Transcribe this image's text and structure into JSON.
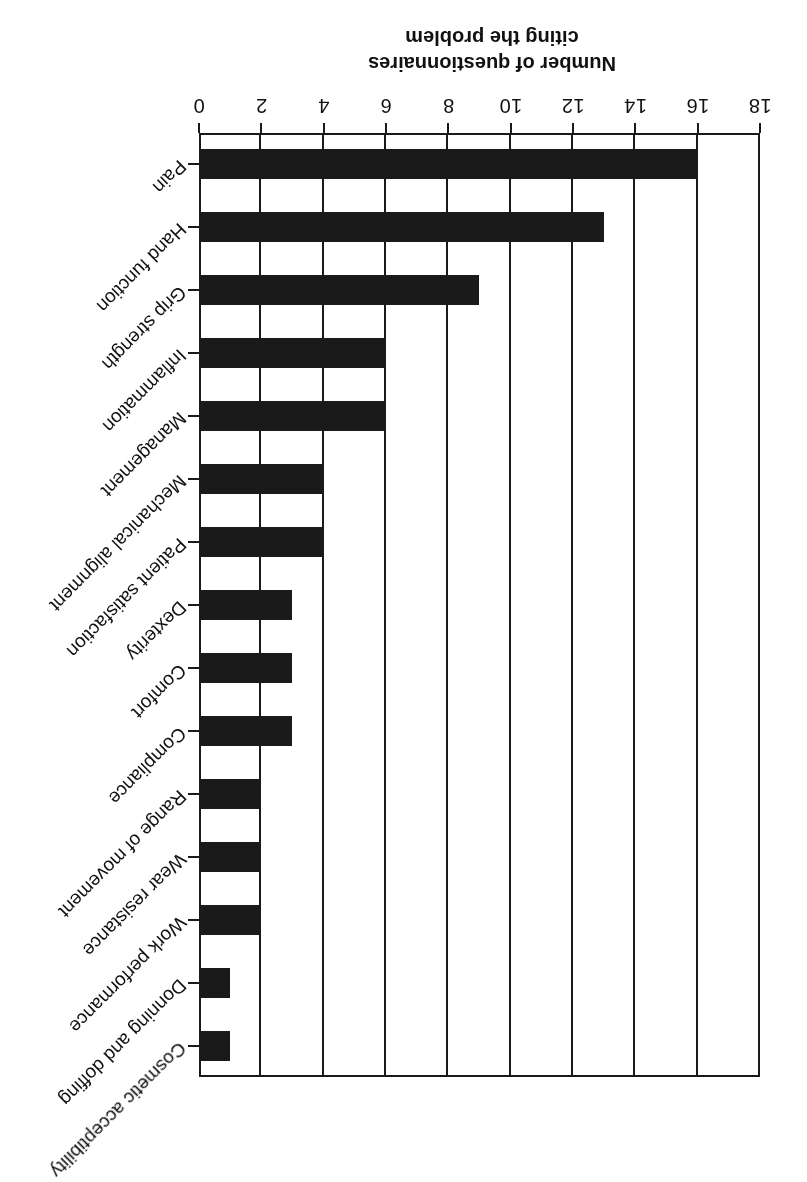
{
  "chart_data": {
    "type": "bar",
    "orientation": "horizontal",
    "title": "",
    "subtitle": "",
    "xlabel": "Number of questionnaires citing the problem",
    "ylabel": "",
    "xlim": [
      0,
      18
    ],
    "xticks": [
      0,
      2,
      4,
      6,
      8,
      10,
      12,
      14,
      16,
      18
    ],
    "xtick_labels": [
      "0",
      "2",
      "4",
      "6",
      "8",
      "10",
      "12",
      "14",
      "16",
      "18"
    ],
    "grid": "vertical gridlines at every x tick",
    "legend": "none",
    "bar_color": "#1a1a1a",
    "background_color": "#ffffff",
    "categories": [
      "Pain",
      "Hand function",
      "Grip strength",
      "Inflammation",
      "Management",
      "Mechanical alignment",
      "Patient satisfaction",
      "Dexterity",
      "Comfort",
      "Compliance",
      "Range of movement",
      "Wear resistance",
      "Work performance",
      "Donning and doffing",
      "Cosmetic acceptibility"
    ],
    "values": [
      16,
      13,
      9,
      6,
      6,
      4,
      4,
      3,
      3,
      3,
      2,
      2,
      2,
      1,
      1
    ],
    "annotations": []
  },
  "axis_title": {
    "line1": "Number of questionnaires",
    "line2": "citing the problem"
  },
  "figure": {
    "caption": "",
    "rotation_note": "180"
  }
}
